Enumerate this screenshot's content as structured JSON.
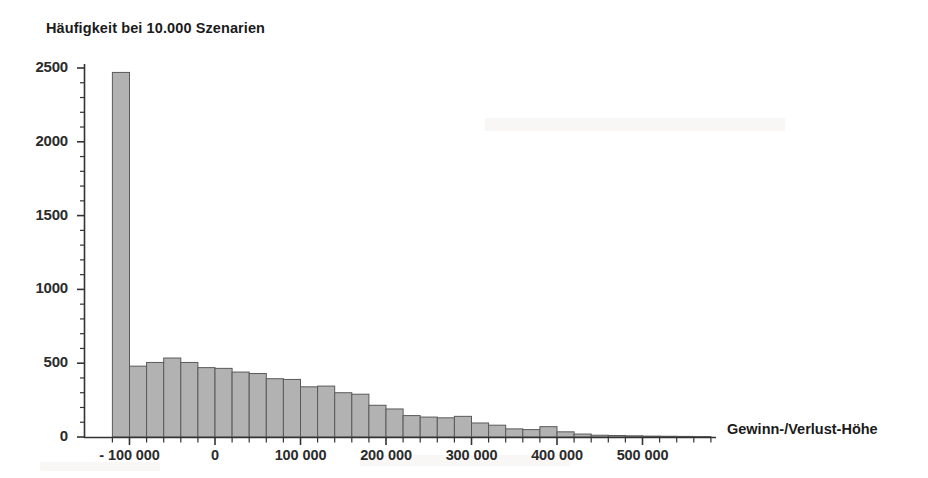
{
  "chart_data": {
    "type": "bar",
    "title": "Häufigkeit bei 10.000 Szenarien",
    "subtitle": "",
    "xlabel": "Gewinn-/Verlust-Höhe",
    "ylabel": "Häufigkeit bei 10.000 Szenarien",
    "grid": false,
    "legend": false,
    "xlim": [
      -130000,
      590000
    ],
    "ylim": [
      0,
      2600
    ],
    "x_tick_labels": [
      "- 100 000",
      "0",
      "100 000",
      "200 000",
      "300 000",
      "400 000",
      "500 000"
    ],
    "x_tick_values": [
      -100000,
      0,
      100000,
      200000,
      300000,
      400000,
      500000
    ],
    "y_tick_labels": [
      "0",
      "500",
      "1000",
      "1500",
      "2000",
      "2500"
    ],
    "y_tick_values": [
      0,
      500,
      1000,
      1500,
      2000,
      2500
    ],
    "y_minor_tick_step": 100,
    "x_minor_tick_step": 20000,
    "bin_width": 20000,
    "bin_starts": [
      -120000,
      -100000,
      -80000,
      -60000,
      -40000,
      -20000,
      0,
      20000,
      40000,
      60000,
      80000,
      100000,
      120000,
      140000,
      160000,
      180000,
      200000,
      220000,
      240000,
      260000,
      280000,
      300000,
      320000,
      340000,
      360000,
      380000,
      400000,
      420000,
      440000,
      460000,
      480000,
      500000,
      520000,
      540000,
      560000
    ],
    "categories": [
      "-120000",
      "-100000",
      "-80000",
      "-60000",
      "-40000",
      "-20000",
      "0",
      "20000",
      "40000",
      "60000",
      "80000",
      "100000",
      "120000",
      "140000",
      "160000",
      "180000",
      "200000",
      "220000",
      "240000",
      "260000",
      "280000",
      "300000",
      "320000",
      "340000",
      "360000",
      "380000",
      "400000",
      "420000",
      "440000",
      "460000",
      "480000",
      "500000",
      "520000",
      "540000",
      "560000"
    ],
    "values": [
      2470,
      480,
      505,
      535,
      505,
      470,
      465,
      440,
      430,
      395,
      390,
      340,
      345,
      300,
      290,
      215,
      190,
      145,
      135,
      130,
      140,
      95,
      80,
      55,
      50,
      70,
      35,
      20,
      12,
      10,
      8,
      6,
      5,
      4,
      3
    ],
    "bar_fill_color": "#b2b2b2",
    "bar_edge_color": "#5a5a5a",
    "axis_color": "#333333",
    "text_color": "#1b1b1b",
    "background_color": "#ffffff"
  },
  "axes": {
    "y_title": "Häufigkeit bei 10.000 Szenarien",
    "x_title": "Gewinn-/Verlust-Höhe"
  }
}
